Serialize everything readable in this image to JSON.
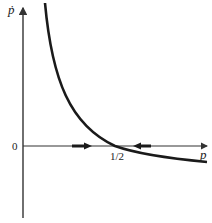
{
  "diagram": {
    "type": "phase-diagram",
    "y_axis_label": "ṗ",
    "x_axis_label": "p",
    "origin_label": "0",
    "equilibrium_label": "1/2",
    "curve": "decreasing convex curve crossing p-axis at 1/2",
    "flow_arrows": [
      {
        "direction": "right",
        "position": "left of equilibrium"
      },
      {
        "direction": "left",
        "position": "right of equilibrium"
      }
    ],
    "colors": {
      "axes": "#333333",
      "curve": "#1a1a1a",
      "background": "#ffffff"
    }
  }
}
